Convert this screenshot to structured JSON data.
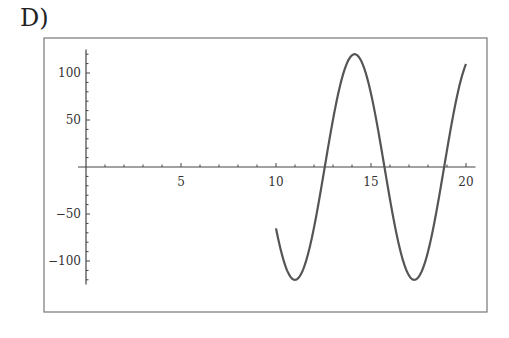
{
  "figure_label": "D)",
  "chart_data": {
    "type": "line",
    "title": "",
    "xlabel": "",
    "ylabel": "",
    "function": "120*sin(x)",
    "x_domain": [
      10,
      20
    ],
    "xlim": [
      0,
      20.5
    ],
    "ylim": [
      -125,
      125
    ],
    "x_ticks": [
      5,
      10,
      15,
      20
    ],
    "x_tick_labels": [
      "5",
      "10",
      "15",
      "20"
    ],
    "y_ticks": [
      100,
      50,
      -50,
      -100
    ],
    "y_tick_labels": [
      "100",
      "50",
      "−50",
      "−100"
    ],
    "grid": false,
    "legend": null,
    "series": [
      {
        "name": "f(x)",
        "x": [
          10,
          11,
          11.0,
          12,
          12.57,
          13,
          14,
          14.14,
          15,
          15.71,
          16,
          17,
          17.28,
          18,
          18.85,
          19,
          20
        ],
        "values": [
          -65.3,
          -120.0,
          -120.0,
          -64.4,
          0,
          50.4,
          119.2,
          120.0,
          78.0,
          0,
          -34.6,
          -115.3,
          -120.0,
          -90.1,
          0,
          18.0,
          109.5
        ]
      }
    ],
    "colors": {
      "curve": "#555555",
      "axes": "#444444",
      "frame": "#666666"
    }
  }
}
